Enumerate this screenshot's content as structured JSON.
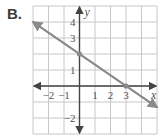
{
  "figure_label": "B.",
  "chart_data": {
    "type": "line",
    "title": "",
    "xlabel": "x",
    "ylabel": "y",
    "xlim": [
      -3,
      5
    ],
    "ylim": [
      -3,
      5
    ],
    "grid": true,
    "x_tick_labels": [
      "-2",
      "-1",
      "1",
      "2",
      "3"
    ],
    "y_tick_labels": [
      "4",
      "3",
      "1",
      "-2"
    ],
    "series": [
      {
        "name": "line",
        "equation": "y = -2/3 x + 2",
        "x": [
          -3,
          5
        ],
        "y": [
          4,
          -1.333
        ],
        "marked_points": [
          [
            0,
            2
          ],
          [
            3,
            0
          ]
        ]
      }
    ]
  },
  "colors": {
    "grid": "#c8c8c8",
    "axes": "#444444",
    "line": "#8a8a8a",
    "text": "#555555"
  }
}
